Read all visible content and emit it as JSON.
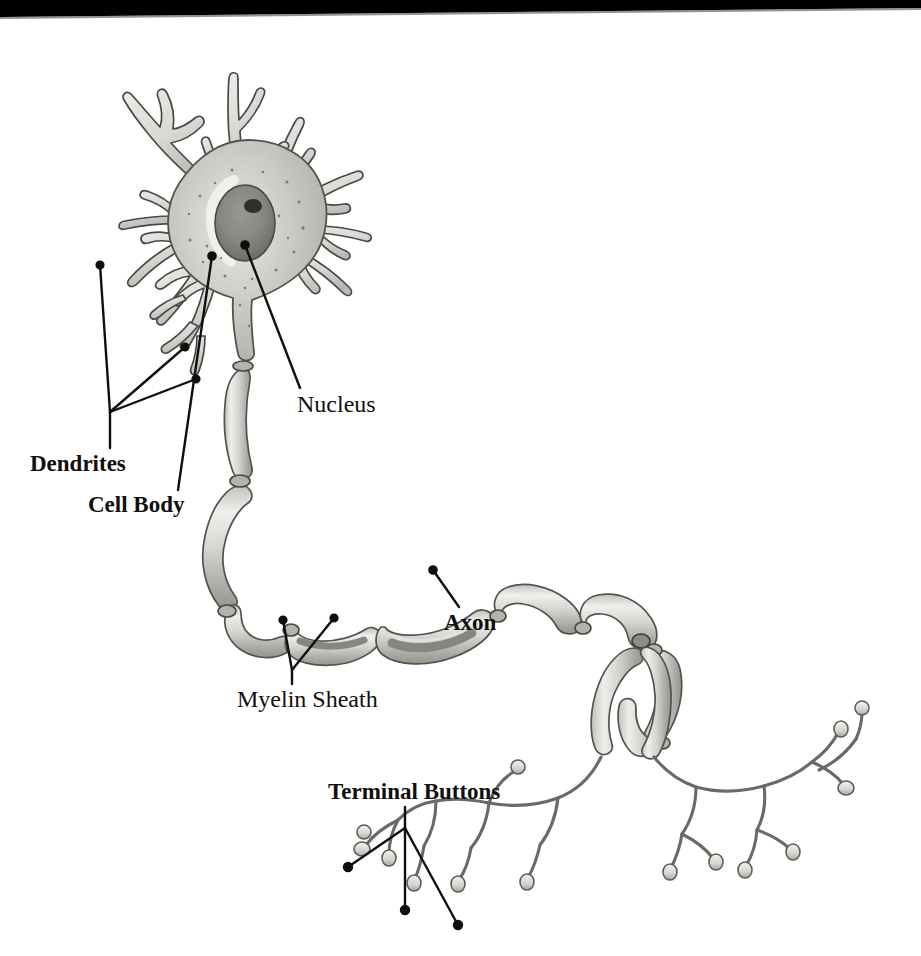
{
  "figure": {
    "kind": "neuron-anatomy-diagram",
    "background_color": "#ffffff",
    "ink_color": "#100f0d",
    "cell_fill_light": "#e9e9e7",
    "cell_fill_mid": "#cfcfcb",
    "cell_fill_dark": "#a9a9a4",
    "nucleus_fill": "#8d8d88",
    "nucleolus_fill": "#33322f",
    "scan_edge_color": "#000000"
  },
  "labels": [
    {
      "id": "dendrites",
      "text": "Dendrites",
      "style": "bold",
      "font_size_px": 23,
      "x": 30,
      "y": 452,
      "leader_count": 3,
      "points_to": "branched dendrite processes on the left of the soma"
    },
    {
      "id": "cell-body",
      "text": "Cell Body",
      "style": "bold",
      "font_size_px": 23,
      "x": 88,
      "y": 493,
      "leader_count": 1,
      "points_to": "cytoplasm of the soma"
    },
    {
      "id": "nucleus",
      "text": "Nucleus",
      "style": "regular",
      "font_size_px": 24,
      "x": 297,
      "y": 392,
      "leader_count": 1,
      "points_to": "dark oval nucleus inside the soma"
    },
    {
      "id": "myelin-sheath",
      "text": "Myelin Sheath",
      "style": "regular",
      "font_size_px": 24,
      "x": 237,
      "y": 687,
      "leader_count": 2,
      "points_to": "two myelin segments wrapping the axon"
    },
    {
      "id": "axon",
      "text": "Axon",
      "style": "bold",
      "font_size_px": 23,
      "x": 444,
      "y": 611,
      "leader_count": 1,
      "points_to": "exposed axon fibre inside a cut-away myelin segment"
    },
    {
      "id": "terminal-buttons",
      "text": "Terminal Buttons",
      "style": "bold",
      "font_size_px": 23,
      "x": 328,
      "y": 780,
      "leader_count": 3,
      "points_to": "bulbous endings of the axon terminal branches"
    }
  ],
  "structures": {
    "soma": {
      "name": "cell body / soma",
      "center_x": 248,
      "center_y": 218
    },
    "nucleus": {
      "name": "nucleus",
      "center_x": 245,
      "center_y": 223
    },
    "nucleolus": {
      "name": "nucleolus",
      "center_x": 252,
      "center_y": 207
    },
    "dendrite_count": 9,
    "myelin_segment_count": 11,
    "nodes_of_ranvier": 10,
    "axon_branch_point": {
      "x": 641,
      "y": 641
    },
    "terminal_tree_count": 2
  }
}
